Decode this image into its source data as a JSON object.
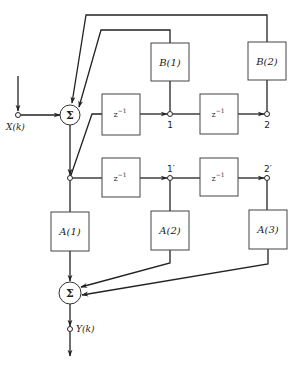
{
  "diagram": {
    "type": "signal-flow block diagram",
    "input": {
      "label": "X(k)"
    },
    "output": {
      "label": "Y(k)"
    },
    "summers": [
      {
        "id": "sum_feedback",
        "symbol": "Σ"
      },
      {
        "id": "sum_output",
        "symbol": "Σ"
      }
    ],
    "delays": [
      {
        "id": "delay_b1",
        "label": "z",
        "exponent": "−1"
      },
      {
        "id": "delay_b2",
        "label": "z",
        "exponent": "−1"
      },
      {
        "id": "delay_a1",
        "label": "z",
        "exponent": "−1"
      },
      {
        "id": "delay_a2",
        "label": "z",
        "exponent": "−1"
      }
    ],
    "coefficients": {
      "feedback": [
        {
          "id": "b1",
          "label": "B(1)"
        },
        {
          "id": "b2",
          "label": "B(2)"
        }
      ],
      "feedforward": [
        {
          "id": "a1",
          "label": "A(1)"
        },
        {
          "id": "a2",
          "label": "A(2)"
        },
        {
          "id": "a3",
          "label": "A(3)"
        }
      ]
    },
    "nodes": {
      "upper": [
        {
          "id": "n1",
          "label": "1"
        },
        {
          "id": "n2",
          "label": "2"
        }
      ],
      "lower": [
        {
          "id": "n1p",
          "label": "1′"
        },
        {
          "id": "n2p",
          "label": "2′"
        }
      ]
    },
    "connections": [
      {
        "from": "X(k)",
        "to": "sum_feedback"
      },
      {
        "from": "sum_feedback",
        "to": "branch"
      },
      {
        "from": "branch",
        "to": "delay_b1"
      },
      {
        "from": "delay_b1",
        "to": "n1"
      },
      {
        "from": "n1",
        "to": "delay_b2"
      },
      {
        "from": "delay_b2",
        "to": "n2"
      },
      {
        "from": "n1",
        "to": "b1"
      },
      {
        "from": "n2",
        "to": "b2"
      },
      {
        "from": "b1",
        "to": "sum_feedback"
      },
      {
        "from": "b2",
        "to": "sum_feedback"
      },
      {
        "from": "branch",
        "to": "delay_a1"
      },
      {
        "from": "delay_a1",
        "to": "n1p"
      },
      {
        "from": "n1p",
        "to": "delay_a2"
      },
      {
        "from": "delay_a2",
        "to": "n2p"
      },
      {
        "from": "branch",
        "to": "a1"
      },
      {
        "from": "n1p",
        "to": "a2"
      },
      {
        "from": "n2p",
        "to": "a3"
      },
      {
        "from": "a1",
        "to": "sum_output"
      },
      {
        "from": "a2",
        "to": "sum_output"
      },
      {
        "from": "a3",
        "to": "sum_output"
      },
      {
        "from": "sum_output",
        "to": "Y(k)"
      }
    ]
  }
}
